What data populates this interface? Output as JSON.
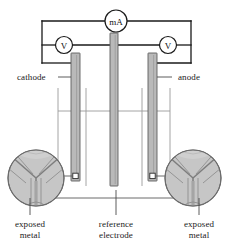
{
  "figure": {
    "background_color": "#ffffff",
    "line_color": "#1a1a1a",
    "electrode_fill": "#b9b9b9",
    "inset_fill": "#c4c4c4",
    "grain_line_color": "#7d7d7d",
    "thin_line_color": "#8c8c8c"
  },
  "meters": {
    "ammeter": {
      "name": "milliammeter",
      "label": "mA",
      "cx": 116,
      "cy": 21,
      "r": 11
    },
    "voltmeter_left": {
      "name": "voltmeter-left",
      "label": "V",
      "cx": 64,
      "cy": 45,
      "r": 8.5
    },
    "voltmeter_right": {
      "name": "voltmeter-right",
      "label": "V",
      "cx": 168,
      "cy": 45,
      "r": 8.5
    }
  },
  "labels": {
    "cathode": "cathode",
    "anode": "anode",
    "exposed_metal_left": "exposed\nmetal",
    "exposed_metal_left_line1": "exposed",
    "exposed_metal_left_line2": "metal",
    "reference_electrode_line1": "reference",
    "reference_electrode_line2": "electrode",
    "exposed_metal_right_line1": "exposed",
    "exposed_metal_right_line2": "metal"
  },
  "electrodes": [
    {
      "name": "cathode-electrode",
      "x": 71,
      "y_top": 53,
      "width": 9,
      "height": 128
    },
    {
      "name": "reference-electrode",
      "x": 110,
      "y_top": 33,
      "width": 8,
      "height": 153
    },
    {
      "name": "anode-electrode",
      "x": 148,
      "y_top": 53,
      "width": 9,
      "height": 128
    }
  ],
  "exposed_metal_markers": [
    {
      "name": "exposed-metal-marker-cathode",
      "cx": 75.5,
      "cy": 176
    },
    {
      "name": "exposed-metal-marker-anode",
      "cx": 152.5,
      "cy": 176
    }
  ],
  "insets": [
    {
      "name": "inset-grain-structure-left",
      "cx": 36,
      "cy": 178,
      "r": 28
    },
    {
      "name": "inset-grain-structure-right",
      "cx": 193,
      "cy": 178,
      "r": 28
    }
  ],
  "vessel": {
    "name": "solution-vessel-outline",
    "left_x": 58,
    "right_x": 170,
    "top_y": 88,
    "inner_left_x": 86,
    "inner_right_x": 142,
    "liquid_line_y": 111
  }
}
